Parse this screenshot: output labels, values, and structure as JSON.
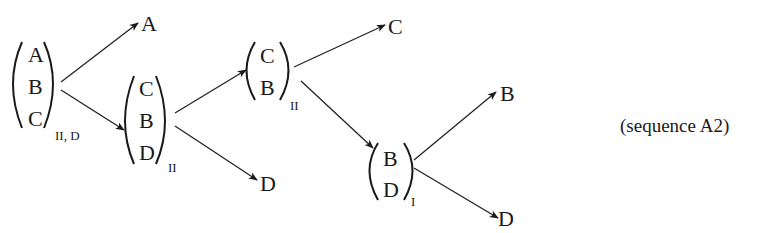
{
  "diagram": {
    "caption": "(sequence A2)",
    "nodes": [
      {
        "id": "n1",
        "type": "group",
        "items": [
          "A",
          "B",
          "C"
        ],
        "subscript": "II, D"
      },
      {
        "id": "n2",
        "type": "leaf",
        "label": "A"
      },
      {
        "id": "n3",
        "type": "group",
        "items": [
          "C",
          "B",
          "D"
        ],
        "subscript": "II"
      },
      {
        "id": "n4",
        "type": "group",
        "items": [
          "C",
          "B"
        ],
        "subscript": "II"
      },
      {
        "id": "n5",
        "type": "leaf",
        "label": "D"
      },
      {
        "id": "n6",
        "type": "leaf",
        "label": "C"
      },
      {
        "id": "n7",
        "type": "group",
        "items": [
          "B",
          "D"
        ],
        "subscript": "I"
      },
      {
        "id": "n8",
        "type": "leaf",
        "label": "B"
      },
      {
        "id": "n9",
        "type": "leaf",
        "label": "D"
      }
    ],
    "edges": [
      {
        "from": "n1",
        "to": "n2"
      },
      {
        "from": "n1",
        "to": "n3"
      },
      {
        "from": "n3",
        "to": "n4"
      },
      {
        "from": "n3",
        "to": "n5"
      },
      {
        "from": "n4",
        "to": "n6"
      },
      {
        "from": "n4",
        "to": "n7"
      },
      {
        "from": "n7",
        "to": "n8"
      },
      {
        "from": "n7",
        "to": "n9"
      }
    ]
  }
}
